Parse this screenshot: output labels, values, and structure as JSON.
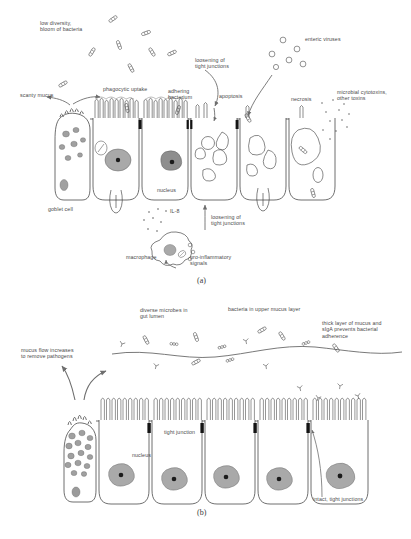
{
  "figure": {
    "type": "two-panel biomedical schematic"
  },
  "panel_a": {
    "id": "(a)",
    "state": "diseased / disrupted barrier",
    "labels": {
      "low_diversity": "low diversity,\nbloom of bacteria",
      "enteric_viruses": "enteric viruses",
      "loosening_top": "loosening of\ntight junctions",
      "apoptosis": "apoptosis",
      "necrosis": "necrosis",
      "cytotoxins": "microbial cytotoxins,\nother toxins",
      "scanty_mucus": "scanty mucus",
      "phagocytic_uptake": "phagocytic uptake",
      "adhering_bacterium": "adhering\nbacterium",
      "goblet_cell": "goblet cell",
      "nucleus": "nucleus",
      "il8": "IL-8",
      "loosening_bottom": "loosening of\ntight junctions",
      "macrophage": "macrophage",
      "pro_inflammatory": "pro-inflammatory\nsignals"
    }
  },
  "panel_b": {
    "id": "(b)",
    "state": "healthy / intact barrier",
    "labels": {
      "diverse_microbes": "diverse microbes in\ngut lumen",
      "bacteria_upper_mucus": "bacteria in upper mucus layer",
      "thick_mucus": "thick layer of mucus and\nsIgA prevents bacterial\nadherence",
      "mucus_flow": "mucus flow increases\nto remove pathogens",
      "tight_junction": "tight junction",
      "nucleus": "nucleus",
      "intact_tight_junctions": "intact, tight junctions"
    }
  },
  "colors": {
    "ink": "#4a4a4a",
    "outline": "#3f3f3f",
    "nucleus_fill": "#a9a9a9",
    "nucleolus": "#1b1b1b",
    "junction": "#141414",
    "arrow": "#6e6e6e",
    "mucus_line": "#6a6a6a",
    "background": "#ffffff"
  }
}
